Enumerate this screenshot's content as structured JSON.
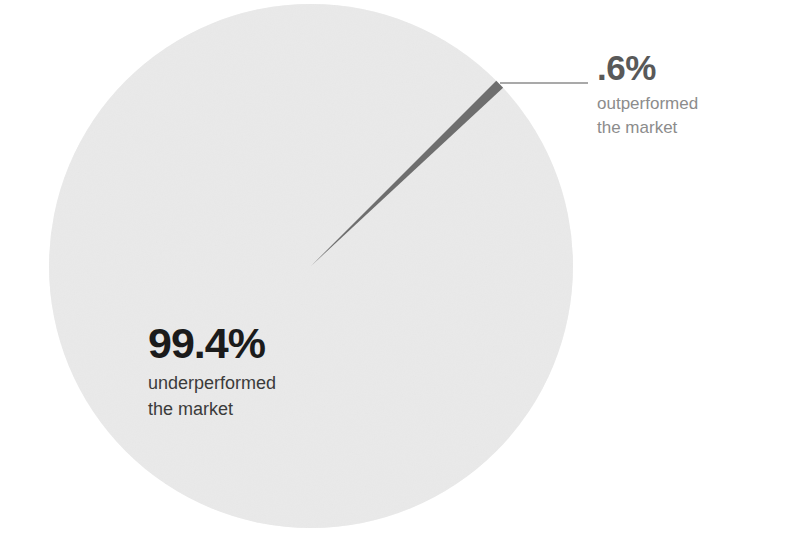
{
  "chart_data": {
    "type": "pie",
    "title": "",
    "subtitle": "",
    "xlabel": "",
    "ylabel": "",
    "grid": false,
    "legend_position": "callout-labels",
    "categories": [
      "underperformed the market",
      "outperformed the market"
    ],
    "values": [
      99.4,
      0.6
    ],
    "slices": [
      {
        "label": "underperformed the market",
        "value_label": "99.4%",
        "value": 99.4,
        "color": "#ececec",
        "label_position": "inside-lower-left"
      },
      {
        "label": "outperformed the market",
        "value_label": ".6%",
        "value": 0.6,
        "color": "#6e6e6e",
        "label_position": "outside-upper-right-leader"
      }
    ],
    "geometry": {
      "center_x": 311,
      "center_y": 266,
      "radius": 262,
      "slice_start_angle_deg": -45,
      "slice_sweep_deg": 2.16
    },
    "annotations": [
      {
        "name": "leader-line",
        "from_x": 500,
        "from_y": 83,
        "to_x": 588,
        "to_y": 83,
        "color": "#8c8c8c"
      }
    ]
  },
  "labels": {
    "outperformed": {
      "percent": ".6%",
      "description_line1": "outperformed",
      "description_line2": "the market"
    },
    "underperformed": {
      "percent": "99.4%",
      "description_line1": "underperformed",
      "description_line2": "the market"
    }
  },
  "colors": {
    "background": "#ffffff",
    "major_slice": "#ececec",
    "minor_slice": "#6e6e6e",
    "leader_line": "#8c8c8c",
    "primary_text": "#1b1b1b",
    "secondary_text": "#3b3b3b",
    "muted_text": "#8c8c8c",
    "callout_heading": "#595959"
  }
}
